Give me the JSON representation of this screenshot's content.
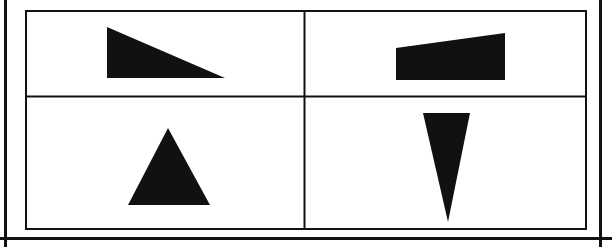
{
  "document": {
    "title": "Geometric Shape Grid Figure",
    "description": "A bordered two-by-two grid containing four solid black geometric shapes, one per cell.",
    "background_color": "#ffffff",
    "ink_color": "#111111",
    "width": 612,
    "height": 247
  },
  "page_rules": [
    {
      "name": "left-margin-rule",
      "orientation": "vertical",
      "x": 5.5,
      "y1": 0,
      "y2": 247,
      "thickness": 3,
      "color": "#111111"
    },
    {
      "name": "right-margin-rule",
      "orientation": "vertical",
      "x": 600.5,
      "y1": 0,
      "y2": 247,
      "thickness": 3,
      "color": "#111111"
    },
    {
      "name": "bottom-horizontal-rule",
      "orientation": "horizontal",
      "y": 238.5,
      "x1": 0,
      "x2": 612,
      "thickness": 3,
      "color": "#111111"
    }
  ],
  "table": {
    "name": "shape-grid-table",
    "rows": 2,
    "columns": 2,
    "outer_border_color": "#111111",
    "outer_border_thickness": 2,
    "inner_border_thickness": 2,
    "bounds": {
      "x": 25,
      "y": 10,
      "width": 562,
      "height": 220
    },
    "column_divider_x": 304.5,
    "row_divider_y": 96.5,
    "cells": [
      {
        "name": "cell-top-left",
        "row": 0,
        "column": 0,
        "bounds": {
          "x": 25,
          "y": 10,
          "width": 279.5,
          "height": 86.5
        },
        "shape": {
          "name": "right-triangle-descending",
          "type": "triangle",
          "description": "Right triangle with vertical left leg, horizontal bottom leg, hypotenuse descending left-to-right",
          "fill": "#111111",
          "points": "107,27 107,78 225,78"
        }
      },
      {
        "name": "cell-top-right",
        "row": 0,
        "column": 1,
        "bounds": {
          "x": 304.5,
          "y": 10,
          "width": 282.5,
          "height": 86.5
        },
        "shape": {
          "name": "wedge-quadrilateral-rising",
          "type": "quadrilateral",
          "description": "Trapezoid shaped block with flat bottom and a top edge rising from left to right",
          "fill": "#111111",
          "points": "396,48 505,33 505,80 396,80"
        }
      },
      {
        "name": "cell-bottom-left",
        "row": 1,
        "column": 0,
        "bounds": {
          "x": 25,
          "y": 96.5,
          "width": 279.5,
          "height": 133.5
        },
        "shape": {
          "name": "triangle-pointing-up",
          "type": "triangle",
          "description": "Broad isosceles triangle pointing upward with horizontal base",
          "fill": "#111111",
          "points": "168,128 210,205 128,205"
        }
      },
      {
        "name": "cell-bottom-right",
        "row": 1,
        "column": 1,
        "bounds": {
          "x": 304.5,
          "y": 96.5,
          "width": 282.5,
          "height": 133.5
        },
        "shape": {
          "name": "triangle-pointing-down-narrow",
          "type": "triangle",
          "description": "Narrow elongated isosceles triangle pointing downward with horizontal top edge",
          "fill": "#111111",
          "points": "423,113 470,113 448,222"
        }
      }
    ]
  }
}
